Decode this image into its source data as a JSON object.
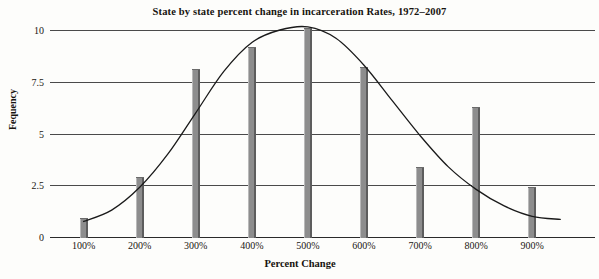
{
  "chart_data": {
    "type": "bar",
    "title": "State by state percent change in incarceration Rates, 1972–2007",
    "xlabel": "Percent Change",
    "ylabel": "Fequency",
    "categories": [
      "100%",
      "200%",
      "300%",
      "400%",
      "500%",
      "600%",
      "700%",
      "800%",
      "900%"
    ],
    "values": [
      0.9,
      2.9,
      8.1,
      9.2,
      10.1,
      8.2,
      3.4,
      6.3,
      2.4
    ],
    "ylim": [
      0,
      10
    ],
    "ytick_labels": [
      "0",
      "2.5",
      "5",
      "7.5",
      "10"
    ],
    "ytick_values": [
      0,
      2.5,
      5,
      7.5,
      10
    ],
    "grid": true,
    "legend": false,
    "overlay": {
      "type": "line",
      "name": "normal distribution curve",
      "description": "smooth bell curve fitted over the bars, peaking near 500%",
      "points": [
        {
          "x": "100%",
          "y": 0.75
        },
        {
          "x": "150%",
          "y": 1.3
        },
        {
          "x": "200%",
          "y": 2.4
        },
        {
          "x": "250%",
          "y": 4.0
        },
        {
          "x": "300%",
          "y": 6.0
        },
        {
          "x": "350%",
          "y": 8.0
        },
        {
          "x": "400%",
          "y": 9.4
        },
        {
          "x": "450%",
          "y": 10.0
        },
        {
          "x": "500%",
          "y": 10.15
        },
        {
          "x": "550%",
          "y": 9.6
        },
        {
          "x": "600%",
          "y": 8.3
        },
        {
          "x": "650%",
          "y": 6.6
        },
        {
          "x": "700%",
          "y": 4.9
        },
        {
          "x": "750%",
          "y": 3.4
        },
        {
          "x": "800%",
          "y": 2.3
        },
        {
          "x": "850%",
          "y": 1.5
        },
        {
          "x": "900%",
          "y": 1.0
        },
        {
          "x": "950%",
          "y": 0.85
        }
      ]
    },
    "colors": {
      "bar_fill": "#8d8d8d",
      "bar_edge_light": "#b9b9b9",
      "bar_edge_dark": "#5d5d5d",
      "gridline": "#4a4a4a",
      "curve": "#1a1a1a",
      "text": "#17140f",
      "background": "#fdfdfb"
    }
  }
}
